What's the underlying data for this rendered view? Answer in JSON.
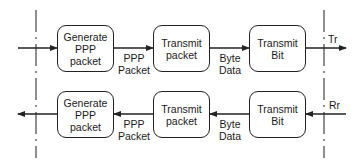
{
  "diagram": {
    "colors": {
      "stroke": "#222222",
      "background": "#ffffff"
    },
    "rows": [
      {
        "name": "transmit-row",
        "direction": "left-to-right",
        "boxes": [
          {
            "id": "tx-generate",
            "label": "Generate\nPPP\npacket"
          },
          {
            "id": "tx-packet",
            "label": "Transmit\npacket"
          },
          {
            "id": "tx-bit",
            "label": "Transmit\nBit"
          }
        ],
        "edge_labels": [
          "PPP\nPacket",
          "Byte\nData"
        ],
        "interface_label": "Tr"
      },
      {
        "name": "receive-row",
        "direction": "right-to-left",
        "boxes": [
          {
            "id": "rx-generate",
            "label": "Generate\nPPP\npacket"
          },
          {
            "id": "rx-packet",
            "label": "Transmit\npacket"
          },
          {
            "id": "rx-bit",
            "label": "Transmit\nBit"
          }
        ],
        "edge_labels": [
          "PPP\nPacket",
          "Byte\nData"
        ],
        "interface_label": "Rr"
      }
    ],
    "boundaries": [
      "left-dashed-boundary",
      "right-dashed-boundary"
    ]
  }
}
